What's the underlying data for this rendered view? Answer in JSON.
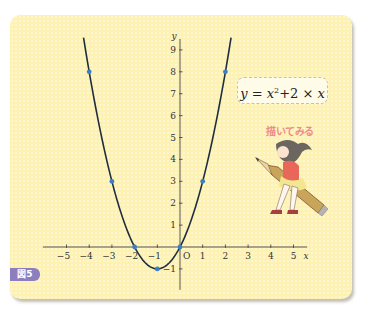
{
  "figure": {
    "badge_label": "図5",
    "formula": {
      "lhs": "y",
      "eq": " = ",
      "base": "x",
      "exp": "2",
      "rest_op": "+2 × ",
      "rest_var": "x"
    },
    "caption": "描いてみる",
    "illustration": "girl-riding-pencil",
    "colors": {
      "panel_bg": "#fdf2b4",
      "curve": "#1f2f3f",
      "points": "#3b7fc4",
      "axis": "#555555",
      "badge": "#8c7fbf",
      "caption": "#ef8a8a"
    }
  },
  "chart_data": {
    "type": "line",
    "function": "y = x^2 + 2x",
    "xlabel": "x",
    "ylabel": "y",
    "origin_label": "O",
    "xlim": [
      -5.6,
      5.6
    ],
    "ylim": [
      -1.5,
      9.5
    ],
    "x_ticks": [
      -5,
      -4,
      -3,
      -2,
      -1,
      1,
      2,
      3,
      4,
      5
    ],
    "y_ticks": [
      -1,
      1,
      2,
      3,
      4,
      5,
      6,
      7,
      8,
      9
    ],
    "curve_x_range": [
      -4.25,
      2.25
    ],
    "points": [
      {
        "x": -4,
        "y": 8
      },
      {
        "x": -3,
        "y": 3
      },
      {
        "x": -2,
        "y": 0
      },
      {
        "x": -1,
        "y": -1
      },
      {
        "x": 0,
        "y": 0
      },
      {
        "x": 1,
        "y": 3
      },
      {
        "x": 2,
        "y": 8
      }
    ],
    "grid": false,
    "legend": null
  }
}
